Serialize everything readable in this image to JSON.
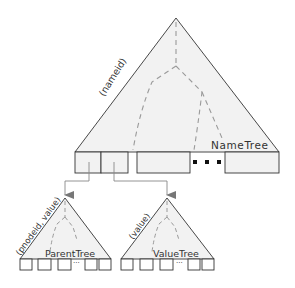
{
  "diagram": {
    "main_tree": {
      "name": "NameTree",
      "key_label": "(nameid)",
      "ellipsis": "..."
    },
    "left_subtree": {
      "name": "ParentTree",
      "key_label": "(pnodeid, value)",
      "ellipsis": "..."
    },
    "right_subtree": {
      "name": "ValueTree",
      "key_label": "(value)",
      "ellipsis": "..."
    },
    "colors": {
      "fill": "#f2f2f2",
      "stroke": "#333333",
      "dashed": "#9a9a9a",
      "arrow": "#777777"
    }
  }
}
